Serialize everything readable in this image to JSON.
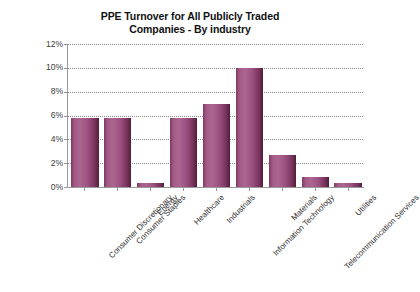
{
  "chart_data": {
    "type": "bar",
    "title": "PPE Turnover for All Publicly Traded\nCompanies - By industry",
    "xlabel": "",
    "ylabel": "",
    "ylim": [
      0,
      12
    ],
    "ytick_labels": [
      "12%",
      "10%",
      "8%",
      "6%",
      "4%",
      "2%",
      "0%"
    ],
    "ytick_values": [
      12,
      10,
      8,
      6,
      4,
      2,
      0
    ],
    "grid": true,
    "legend": "none",
    "categories": [
      "Consumer Discretionary",
      "Consumer Staples",
      "Energy",
      "Healthcare",
      "Industrials",
      "Information Technology",
      "Materials",
      "Telecommunication Services",
      "Utilities"
    ],
    "values": [
      5.8,
      5.8,
      0.3,
      5.8,
      7.0,
      10.0,
      2.7,
      0.8,
      0.3
    ],
    "bar_color": "#8e4a73",
    "bar_edge_color": "#50203c",
    "background_color": "#ffffff",
    "axis_color": "#9a9a9a",
    "grid_color": "#8d8d8d",
    "text_color": "#1a1a1a"
  }
}
